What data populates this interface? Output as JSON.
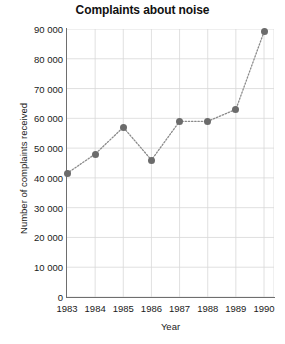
{
  "chart_data": {
    "type": "line",
    "title": "Complaints about noise",
    "xlabel": "Year",
    "ylabel": "Number of complaints received",
    "categories": [
      "1983",
      "1984",
      "1985",
      "1986",
      "1987",
      "1988",
      "1989",
      "1990"
    ],
    "x": [
      1983,
      1984,
      1985,
      1986,
      1987,
      1988,
      1989,
      1990
    ],
    "values": [
      41500,
      48000,
      57000,
      46000,
      59000,
      59000,
      63000,
      89000
    ],
    "ylim": [
      0,
      90000
    ],
    "ytick_values": [
      0,
      10000,
      20000,
      30000,
      40000,
      50000,
      60000,
      70000,
      80000,
      90000
    ],
    "ytick_labels": [
      "0",
      "10 000",
      "20 000",
      "30 000",
      "40 000",
      "50 000",
      "60 000",
      "70 000",
      "80 000",
      "90 000"
    ],
    "grid": true,
    "legend": null,
    "line_style": "dotted",
    "marker": "circle",
    "colors": {
      "marker": "#6b6b6b",
      "line": "#8a8a8a",
      "grid": "#d8d8d8",
      "axis": "#6e6e6e",
      "text": "#1a1a1a",
      "background": "#ffffff"
    }
  }
}
